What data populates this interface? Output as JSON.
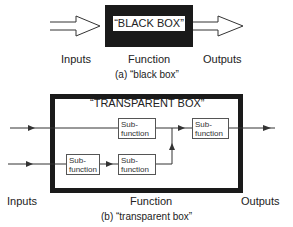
{
  "black_box": {
    "title": "“BLACK BOX”",
    "labels": {
      "inputs": "Inputs",
      "function": "Function",
      "outputs": "Outputs"
    },
    "caption": "(a) “black box”"
  },
  "transparent_box": {
    "title": "“TRANSPARENT BOX”",
    "subfunctions": [
      {
        "line1": "Sub-",
        "line2": "function"
      },
      {
        "line1": "Sub-",
        "line2": "function"
      },
      {
        "line1": "Sub-",
        "line2": "function"
      },
      {
        "line1": "Sub-",
        "line2": "function"
      }
    ],
    "labels": {
      "inputs": "Inputs",
      "function": "Function",
      "outputs": "Outputs"
    },
    "caption": "(b) “transparent box”"
  },
  "colors": {
    "ink": "#222222",
    "box_fill": "#1a1a1a",
    "background": "#ffffff"
  }
}
